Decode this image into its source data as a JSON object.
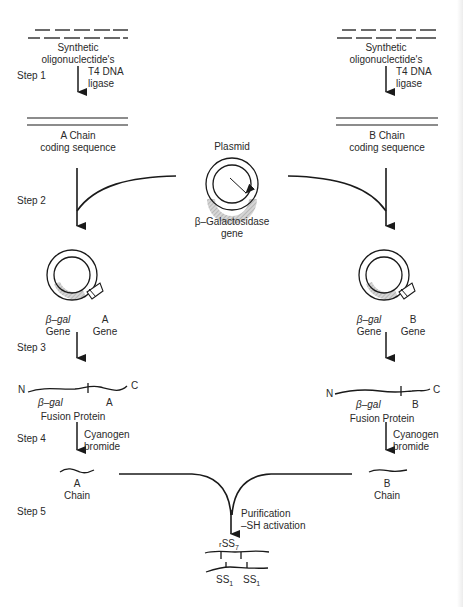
{
  "figure": {
    "steps": [
      "Step 1",
      "Step 2",
      "Step 3",
      "Step 4",
      "Step 5"
    ],
    "left": {
      "oligo_label": [
        "Synthetic",
        "oligonuclectide's"
      ],
      "ligase_label": [
        "T4 DNA",
        "ligase"
      ],
      "coding_label": [
        "A Chain",
        "coding sequence"
      ],
      "plasmid_labels": {
        "gal": [
          "β–gal",
          "Gene"
        ],
        "chain": [
          "A",
          "Gene"
        ]
      },
      "fusion": {
        "n": "N",
        "c": "C",
        "gal": "β–gal",
        "chain": "A",
        "label": "Fusion  Protein"
      },
      "cleave_label": [
        "Cyanogen",
        "bromide"
      ],
      "chain_label": [
        "A",
        "Chain"
      ]
    },
    "right": {
      "oligo_label": [
        "Synthetic",
        "oligonuclectide's"
      ],
      "ligase_label": [
        "T4 DNA",
        "ligase"
      ],
      "coding_label": [
        "B Chain",
        "coding sequence"
      ],
      "plasmid_labels": {
        "gal": [
          "β–gal",
          "Gene"
        ],
        "chain": [
          "B",
          "Gene"
        ]
      },
      "fusion": {
        "n": "N",
        "c": "C",
        "gal": "β–gal",
        "chain": "B",
        "label": "Fusion  Protein"
      },
      "cleave_label": [
        "Cyanogen",
        "bromide"
      ],
      "chain_label": [
        "B",
        "Chain"
      ]
    },
    "center": {
      "plasmid_title": "Plasmid",
      "gene_label": [
        "β–Galactosidase",
        "gene"
      ],
      "purification": [
        "Purification",
        "–SH activation"
      ],
      "disulfide_top": {
        "prefix": "r",
        "text": "SS",
        "sub": "7"
      },
      "disulfide_bottom": [
        {
          "text": "SS",
          "sub": "1"
        },
        {
          "text": "SS",
          "sub": "1"
        }
      ]
    }
  },
  "colors": {
    "ink": "#1a1a1a",
    "hatch": "#9a9a9a",
    "background": "#ffffff"
  }
}
